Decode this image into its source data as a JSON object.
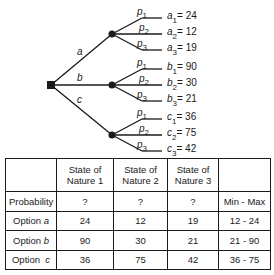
{
  "tree": {
    "decision_node": "decision-square",
    "options": [
      {
        "label": "a",
        "branches": [
          {
            "prob": "p",
            "prob_sub": "1",
            "outcome_var": "a",
            "outcome_sub": "1",
            "value": "= 24"
          },
          {
            "prob": "p",
            "prob_sub": "2",
            "outcome_var": "a",
            "outcome_sub": "2",
            "value": "= 12"
          },
          {
            "prob": "p",
            "prob_sub": "3",
            "outcome_var": "a",
            "outcome_sub": "3",
            "value": "= 19"
          }
        ]
      },
      {
        "label": "b",
        "branches": [
          {
            "prob": "p",
            "prob_sub": "1",
            "outcome_var": "b",
            "outcome_sub": "1",
            "value": "= 90"
          },
          {
            "prob": "p",
            "prob_sub": "2",
            "outcome_var": "b",
            "outcome_sub": "2",
            "value": "= 30"
          },
          {
            "prob": "p",
            "prob_sub": "3",
            "outcome_var": "b",
            "outcome_sub": "3",
            "value": "= 21"
          }
        ]
      },
      {
        "label": "c",
        "branches": [
          {
            "prob": "p",
            "prob_sub": "1",
            "outcome_var": "c",
            "outcome_sub": "1",
            "value": "= 36"
          },
          {
            "prob": "p",
            "prob_sub": "2",
            "outcome_var": "c",
            "outcome_sub": "2",
            "value": "= 75"
          },
          {
            "prob": "p",
            "prob_sub": "3",
            "outcome_var": "c",
            "outcome_sub": "3",
            "value": "= 42"
          }
        ]
      }
    ]
  },
  "table": {
    "header": [
      "",
      "State of Nature 1",
      "State of Nature 2",
      "State of Nature 3",
      ""
    ],
    "header_lines": [
      [
        "",
        ""
      ],
      [
        "State of",
        "Nature 1"
      ],
      [
        "State of",
        "Nature 2"
      ],
      [
        "State of",
        "Nature 3"
      ],
      [
        "",
        ""
      ]
    ],
    "rows": [
      {
        "label": "Probability",
        "label_prefix": "Probability",
        "label_var": "",
        "cells": [
          "?",
          "?",
          "?"
        ],
        "range": "Min - Max"
      },
      {
        "label": "Option a",
        "label_prefix": "Option ",
        "label_var": "a",
        "cells": [
          "24",
          "12",
          "19"
        ],
        "range": "12 - 24"
      },
      {
        "label": "Option b",
        "label_prefix": "Option ",
        "label_var": "b",
        "cells": [
          "90",
          "30",
          "21"
        ],
        "range": "21 - 90"
      },
      {
        "label": "Option c",
        "label_prefix": "Option  ",
        "label_var": "c",
        "cells": [
          "36",
          "75",
          "42"
        ],
        "range": "36 - 75"
      }
    ]
  }
}
